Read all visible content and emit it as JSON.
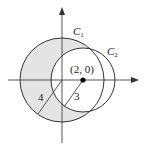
{
  "diagram": {
    "title": "",
    "circles": [
      {
        "name": "C1",
        "label": "C",
        "subscript": "1",
        "center": [
          0,
          0
        ],
        "radius": 4
      },
      {
        "name": "C2",
        "label": "C",
        "subscript": "2",
        "center": [
          2,
          0
        ],
        "radius": 3
      }
    ],
    "center_point_label": "(2, 0)",
    "radius_labels": {
      "r1": "4",
      "r2": "3"
    },
    "shaded_region": "inside C1, outside C2",
    "colors": {
      "shade": "#e4e4e4",
      "stroke": "#333333",
      "axis": "#555555",
      "point": "#000000"
    }
  }
}
